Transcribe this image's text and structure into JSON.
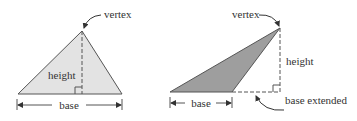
{
  "colors": {
    "left_fill": "#e3e3e3",
    "right_fill": "#9e9e9e",
    "stroke": "#555555",
    "text": "#333333"
  },
  "left_triangle": {
    "labels": {
      "vertex": "vertex",
      "height": "height",
      "base": "base"
    }
  },
  "right_triangle": {
    "labels": {
      "vertex": "vertex",
      "height": "height",
      "base": "base",
      "base_extended": "base extended"
    }
  }
}
